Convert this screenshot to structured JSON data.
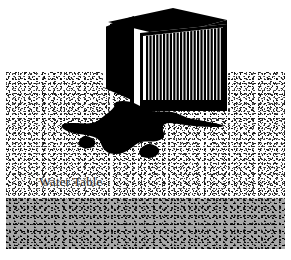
{
  "diagram": {
    "labels": {
      "water_table": "Water Table"
    },
    "colors": {
      "soil_background": "#ffffff",
      "soil_stipple": "#000000",
      "saturated_zone": "#a8a8a8",
      "contaminant_plume": "#000000",
      "tank_body": "#000000",
      "tank_frame": "#ffffff",
      "label_text": "#101010"
    },
    "elements": {
      "tank": {
        "name": "storage-tank",
        "top_panel": "solid dark slab",
        "left_panel": "solid dark side face",
        "front_panel": "finned grille",
        "fin_count": 27,
        "leg": "base support"
      },
      "plume": {
        "name": "contaminant-plume",
        "description": "irregular dark spill spreading laterally through unsaturated soil"
      },
      "zones": [
        {
          "name": "unsaturated-zone",
          "fill": "stippled",
          "top": 72,
          "bottom": 199
        },
        {
          "name": "saturated-zone",
          "fill": "gray stippled",
          "top": 199,
          "bottom": 249
        }
      ]
    }
  }
}
